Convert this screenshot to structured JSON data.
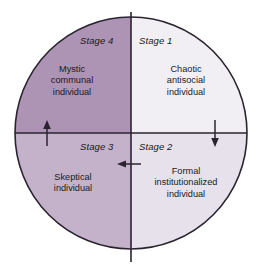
{
  "diagram": {
    "shape": "circle",
    "colors": {
      "background": "#ffffff",
      "outline": "#2b2430",
      "axis": "#2b2430",
      "text": "#1a1a1a",
      "quadrant_top_left": "#ad93b4",
      "quadrant_top_right": "#f2eff4",
      "quadrant_bottom_left": "#c4b2cb",
      "quadrant_bottom_right": "#e6e1ea"
    },
    "geometry": {
      "center_x": 131,
      "center_y": 133,
      "radius": 116
    },
    "quadrants": [
      {
        "id": "stage-1",
        "position": "top-right",
        "stage_label": "Stage 1",
        "description_lines": [
          "Chaotic",
          "antisocial",
          "individual"
        ],
        "fill": "#f2eff4"
      },
      {
        "id": "stage-2",
        "position": "bottom-right",
        "stage_label": "Stage 2",
        "description_lines": [
          "Formal",
          "institutionalized",
          "individual"
        ],
        "fill": "#e6e1ea"
      },
      {
        "id": "stage-3",
        "position": "bottom-left",
        "stage_label": "Stage 3",
        "description_lines": [
          "Skeptical",
          "individual"
        ],
        "fill": "#c4b2cb"
      },
      {
        "id": "stage-4",
        "position": "top-left",
        "stage_label": "Stage 4",
        "description_lines": [
          "Mystic",
          "communal",
          "individual"
        ],
        "fill": "#ad93b4"
      }
    ],
    "arrows": [
      {
        "id": "arrow-up-left",
        "direction": "up",
        "meaning": "stage-3-to-stage-4"
      },
      {
        "id": "arrow-down-right",
        "direction": "down",
        "meaning": "stage-1-to-stage-2"
      },
      {
        "id": "arrow-left-lower",
        "direction": "left",
        "meaning": "stage-2-to-stage-3"
      }
    ]
  }
}
